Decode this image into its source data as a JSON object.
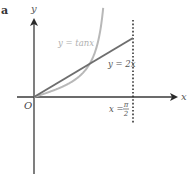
{
  "figure": {
    "panel_label": "a",
    "axis_labels": {
      "x": "x",
      "y": "y",
      "origin": "O"
    },
    "curves": [
      {
        "name": "tan",
        "label": "y = tanx",
        "color": "#b8b8b8"
      },
      {
        "name": "line",
        "label": "y = 2x",
        "color": "#6e6e6e"
      }
    ],
    "asymptote": {
      "label_prefix": "x =",
      "numerator": "π",
      "denominator": "2",
      "style": "dotted"
    },
    "colors": {
      "axis": "#3a3a3a",
      "text": "#555555",
      "tan_label": "#b0b0b0"
    }
  }
}
